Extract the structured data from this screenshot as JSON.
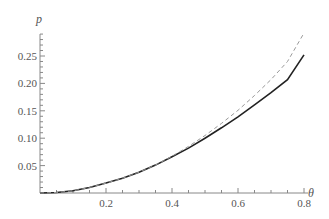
{
  "chart_data": {
    "type": "line",
    "title": "",
    "xlabel": "θ",
    "ylabel": "p",
    "xlim": [
      0,
      0.8
    ],
    "ylim": [
      0,
      0.29
    ],
    "x_ticks": [
      "0.2",
      "0.4",
      "0.6",
      "0.8"
    ],
    "y_ticks": [
      "0.05",
      "0.10",
      "0.15",
      "0.20",
      "0.25"
    ],
    "grid": false,
    "legend": null,
    "series": [
      {
        "name": "solid",
        "style": "solid",
        "color": "#222222",
        "x": [
          0.0,
          0.05,
          0.1,
          0.15,
          0.2,
          0.25,
          0.3,
          0.35,
          0.4,
          0.45,
          0.5,
          0.55,
          0.6,
          0.65,
          0.7,
          0.75,
          0.8
        ],
        "y": [
          0.0,
          0.001,
          0.004,
          0.01,
          0.018,
          0.027,
          0.038,
          0.051,
          0.066,
          0.082,
          0.1,
          0.119,
          0.139,
          0.161,
          0.183,
          0.207,
          0.252
        ]
      },
      {
        "name": "dashed",
        "style": "dashed",
        "color": "#999999",
        "x": [
          0.0,
          0.05,
          0.1,
          0.15,
          0.2,
          0.25,
          0.3,
          0.35,
          0.4,
          0.45,
          0.5,
          0.55,
          0.6,
          0.65,
          0.7,
          0.75,
          0.8
        ],
        "y": [
          0.0,
          0.001,
          0.004,
          0.01,
          0.018,
          0.027,
          0.038,
          0.051,
          0.067,
          0.085,
          0.105,
          0.127,
          0.151,
          0.178,
          0.207,
          0.24,
          0.292
        ]
      }
    ]
  }
}
